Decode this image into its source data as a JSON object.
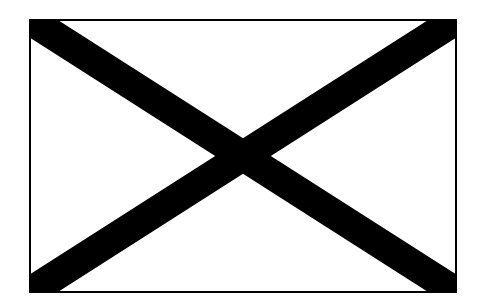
{
  "figure": {
    "frame": {
      "x": 30,
      "y": 20,
      "width": 426,
      "height": 272,
      "stroke": "#000000",
      "stroke_width": 2,
      "fill": "#ffffff"
    },
    "cross": {
      "color": "#000000",
      "bar_width": 30
    }
  }
}
